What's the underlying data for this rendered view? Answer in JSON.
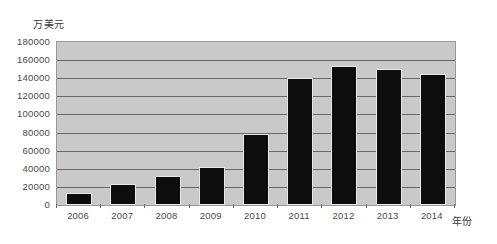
{
  "chart_data": {
    "type": "bar",
    "title": "",
    "subtitle": "",
    "xlabel": "年份",
    "ylabel": "万美元",
    "categories": [
      "2006",
      "2007",
      "2008",
      "2009",
      "2010",
      "2011",
      "2012",
      "2013",
      "2014"
    ],
    "values": [
      13000,
      23000,
      32000,
      42000,
      78000,
      140000,
      153000,
      150000,
      145000
    ],
    "series": [
      {
        "name": "",
        "values": [
          13000,
          23000,
          32000,
          42000,
          78000,
          140000,
          153000,
          150000,
          145000
        ]
      }
    ],
    "ylim": [
      0,
      180000
    ],
    "ytick_step": 20000,
    "ytick_labels": [
      "180000",
      "160000",
      "140000",
      "120000",
      "100000",
      "80000",
      "60000",
      "40000",
      "20000",
      "0"
    ],
    "ytick_values": [
      180000,
      160000,
      140000,
      120000,
      100000,
      80000,
      60000,
      40000,
      20000,
      0
    ],
    "grid": true,
    "grid_axis": "y",
    "legend": false,
    "legend_position": "none",
    "bar_color": "#0d0d0d",
    "plot_background": "#c9c9c9",
    "gridline_color": "#6a6a6a",
    "page_background": "#ffffff",
    "annotations": []
  }
}
